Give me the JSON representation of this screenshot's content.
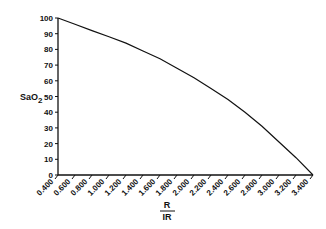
{
  "chart_data": {
    "type": "line",
    "title": "",
    "xlabel": "R / IR",
    "xlabel_numerator": "R",
    "xlabel_denominator": "IR",
    "ylabel": "SaO2",
    "ylabel_main": "SaO",
    "ylabel_sub": "2",
    "xlim": [
      0.4,
      3.4
    ],
    "ylim": [
      0,
      100
    ],
    "grid": false,
    "legend": null,
    "x_ticks": [
      "0.400",
      "0.600",
      "0.800",
      "1.000",
      "1.200",
      "1.400",
      "1.600",
      "1.800",
      "2.000",
      "2.200",
      "2.400",
      "2.600",
      "2.800",
      "3.000",
      "3.200",
      "3.400"
    ],
    "y_ticks": [
      "0",
      "10",
      "20",
      "30",
      "40",
      "50",
      "60",
      "70",
      "80",
      "90",
      "100"
    ],
    "series": [
      {
        "name": "SaO2 calibration curve",
        "x": [
          0.4,
          0.6,
          0.8,
          1.0,
          1.2,
          1.4,
          1.6,
          1.8,
          2.0,
          2.2,
          2.4,
          2.6,
          2.8,
          3.0,
          3.2,
          3.4
        ],
        "y": [
          100,
          96,
          92,
          88,
          84,
          79,
          74,
          68,
          62,
          55,
          48,
          40,
          31,
          21,
          11,
          0
        ]
      }
    ],
    "color": "#111111"
  }
}
